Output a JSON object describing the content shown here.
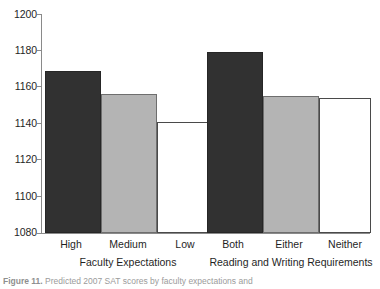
{
  "chart_data": {
    "type": "bar",
    "title": "",
    "subtitle": "",
    "xlabel": "",
    "ylabel": "",
    "ylim": [
      1080,
      1200
    ],
    "yticks": [
      1080,
      1100,
      1120,
      1140,
      1160,
      1180,
      1200
    ],
    "ytick_labels": [
      "1080",
      "1100",
      "1120",
      "1140",
      "1160",
      "1180",
      "1200"
    ],
    "grid": false,
    "legend": "none",
    "categories": [
      "High",
      "Medium",
      "Low",
      "Both",
      "Either",
      "Neither"
    ],
    "values": [
      1169,
      1156,
      1141,
      1179,
      1155,
      1154
    ],
    "bar_colors": [
      "#313131",
      "#b4b4b4",
      "#ffffff",
      "#313131",
      "#b4b4b4",
      "#ffffff"
    ],
    "groups": [
      {
        "label": "Faculty Expectations",
        "categories": [
          "High",
          "Medium",
          "Low"
        ],
        "values": [
          1169,
          1156,
          1141
        ]
      },
      {
        "label": "Reading and Writing Requirements",
        "categories": [
          "Both",
          "Either",
          "Neither"
        ],
        "values": [
          1179,
          1155,
          1154
        ]
      }
    ]
  },
  "axis": {
    "y_tick_0": "1200",
    "y_tick_1": "1180",
    "y_tick_2": "1160",
    "y_tick_3": "1140",
    "y_tick_4": "1120",
    "y_tick_5": "1100",
    "y_tick_6": "1080"
  },
  "categories": {
    "c0": "High",
    "c1": "Medium",
    "c2": "Low",
    "c3": "Both",
    "c4": "Either",
    "c5": "Neither"
  },
  "groups": {
    "g0": "Faculty Expectations",
    "g1": "Reading and Writing Requirements"
  },
  "caption": {
    "figure_number": "Figure 11.",
    "text": "Predicted 2007 SAT scores by faculty expectations and"
  },
  "colors": {
    "bar_dark": "#313131",
    "bar_gray": "#b4b4b4",
    "bar_white": "#ffffff",
    "axis": "#8a8a8a",
    "text": "#1f1f1f"
  }
}
